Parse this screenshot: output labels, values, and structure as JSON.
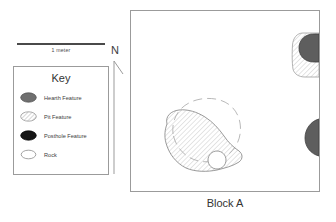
{
  "figure": {
    "name": "archaeological-site-plan",
    "caption": "Block A"
  },
  "scale_bar": {
    "label": "1 meter"
  },
  "north_arrow": {
    "label": "N"
  },
  "key": {
    "title": "Key",
    "items": [
      {
        "symbol": "filled-gray-ellipse",
        "label": "Hearth Feature",
        "color": "#6f6f6f"
      },
      {
        "symbol": "hatched-ellipse",
        "label": "Pit Feature",
        "color": "#8a8a8a"
      },
      {
        "symbol": "filled-black-ellipse",
        "label": "Posthole Feature",
        "color": "#161616"
      },
      {
        "symbol": "open-ellipse",
        "label": "Rock",
        "color": "#ffffff"
      }
    ]
  },
  "map": {
    "label": "Block A",
    "features": [
      {
        "id": "hearth-outline-center",
        "type": "hearth-feature",
        "style": "dashed-outline",
        "note": "large dashed circular hearth outline in center of block"
      },
      {
        "id": "pit-center",
        "type": "pit-feature",
        "style": "diagonal-hatch",
        "note": "large hatched pit feature overlapping the central hearth"
      },
      {
        "id": "rock-center",
        "type": "rock",
        "style": "open-outline",
        "note": "small rock at lower right edge of central pit"
      },
      {
        "id": "pit-northeast",
        "type": "pit-feature",
        "style": "diagonal-hatch",
        "note": "hatched pit at upper right, cut by east block edge"
      },
      {
        "id": "hearth-northeast",
        "type": "hearth-feature",
        "style": "solid-gray-fill",
        "note": "dark gray hearth overlapping the upper-right pit"
      },
      {
        "id": "hearth-east",
        "type": "hearth-feature",
        "style": "solid-gray-fill",
        "note": "dark gray hearth on east edge, partially outside block"
      }
    ]
  },
  "colors": {
    "frame_stroke": "#9b9b9b",
    "feature_stroke": "#8a8a8a",
    "hearth_fill": "#6f6f6f",
    "posthole_fill": "#161616",
    "text": "#3a3a3a",
    "background": "#ffffff"
  }
}
